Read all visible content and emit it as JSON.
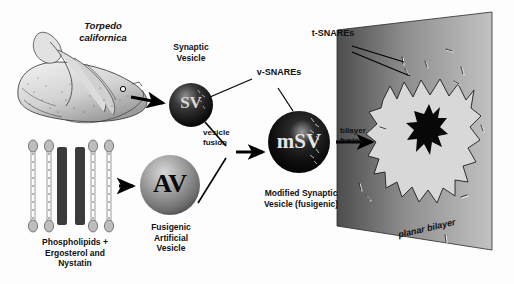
{
  "figure": {
    "title_organism": "Torpedo\ncalifornica",
    "labels": {
      "synaptic_vesicle": "Synaptic\nVesicle",
      "v_snares": "v-SNAREs",
      "t_snares": "t-SNAREs",
      "vesicle_fusion": "vesicle\nfusion",
      "bilayer_fusion": "bilayer\nfusion",
      "modified_vesicle": "Modified Synaptic\nVesicle (fusigenic)",
      "fusigenic_vesicle": "Fusigenic\nArtificial\nVesicle",
      "lipid_mix": "Phospholipids +\nErgosterol and\nNystatin",
      "planar_bilayer": "planar bilayer"
    },
    "vesicles": [
      {
        "id": "sv",
        "text": "SV",
        "tone": "dark"
      },
      {
        "id": "av",
        "text": "AV",
        "tone": "mid"
      },
      {
        "id": "msv",
        "text": "mSV",
        "tone": "darkest"
      }
    ],
    "colors": {
      "ink": "#000000",
      "background": "#fdfdfd",
      "vesicle_dark": "#1a1a1a",
      "vesicle_mid": "#8a8a8a",
      "bilayer_left": "#4a4a4a",
      "bilayer_right": "#b9b9b9",
      "starburst_fill": "#d8d8d8",
      "pore_fill": "#080808",
      "lipid_head": "#bdbdbd",
      "sterol_bar": "#3b3b3b"
    }
  }
}
